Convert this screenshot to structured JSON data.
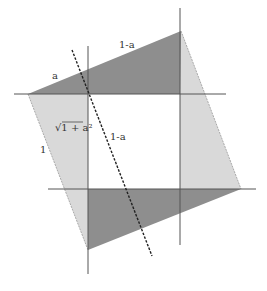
{
  "diagram": {
    "colors": {
      "background": "#ffffff",
      "dark_shade": "#8e8e8e",
      "light_shade": "#d9d9d9",
      "line": "#555555",
      "dashed": "#222222"
    },
    "labels": {
      "top_left_short": "a",
      "top_long": "1-a",
      "hypotenuse": "√1 + a²",
      "inner_segment": "1-a",
      "left_side": "1"
    },
    "outer_square": {
      "vertices": [
        [
          181,
          31
        ],
        [
          241,
          189
        ],
        [
          88,
          250
        ],
        [
          28,
          94
        ]
      ]
    },
    "inner_square": {
      "x1": 88,
      "y1": 94,
      "x2": 180,
      "y2": 189
    },
    "grid_lines": {
      "vertical": [
        88,
        180
      ],
      "horizontal": [
        94,
        189
      ]
    },
    "dashed_line": {
      "x1": 72,
      "y1": 50,
      "x2": 152,
      "y2": 256
    }
  }
}
